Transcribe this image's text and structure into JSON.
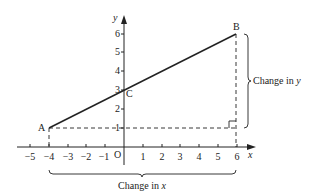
{
  "diagram": {
    "type": "coordinate-graph-gradient",
    "colors": {
      "ink": "#222222",
      "background": "#ffffff"
    },
    "axes": {
      "x_label": "x",
      "y_label": "y",
      "origin_label": "O",
      "x_ticks": [
        "−5",
        "−4",
        "−3",
        "−2",
        "−1",
        "1",
        "2",
        "3",
        "4",
        "5",
        "6"
      ],
      "y_ticks": [
        "1",
        "2",
        "3",
        "4",
        "5",
        "6"
      ]
    },
    "points": {
      "A": {
        "label": "A",
        "x": -4,
        "y": 1
      },
      "B": {
        "label": "B",
        "x": 6,
        "y": 6
      },
      "C": {
        "label": "C",
        "x": 0,
        "y": 3
      }
    },
    "annotations": {
      "change_in_x": "Change in x",
      "change_in_x_prefix": "Change in ",
      "change_in_x_var": "x",
      "change_in_y": "Change in y",
      "change_in_y_prefix": "Change in ",
      "change_in_y_var": "y"
    }
  }
}
